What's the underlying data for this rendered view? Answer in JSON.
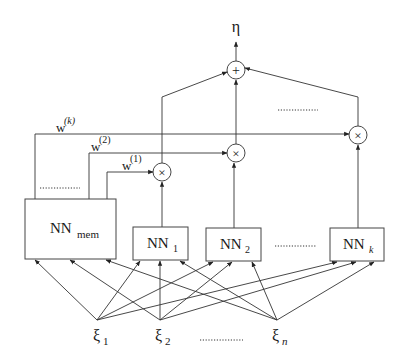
{
  "diagram": {
    "type": "neural-network-ensemble",
    "output": {
      "label": "η"
    },
    "sum_node": {
      "symbol": "+"
    },
    "product_nodes": [
      {
        "id": "x1",
        "symbol": "×"
      },
      {
        "id": "x2",
        "symbol": "×"
      },
      {
        "id": "xk",
        "symbol": "×"
      }
    ],
    "weights": [
      {
        "base": "w",
        "sup": "(1)"
      },
      {
        "base": "w",
        "sup": "(2)"
      },
      {
        "base": "w",
        "sup": "(k)"
      }
    ],
    "networks": {
      "memory": {
        "base": "NN",
        "sub": "mem"
      },
      "experts": [
        {
          "base": "NN",
          "sub": "1"
        },
        {
          "base": "NN",
          "sub": "2"
        },
        {
          "base": "NN",
          "sub": "k"
        }
      ]
    },
    "inputs": [
      {
        "base": "ξ",
        "sub": "1"
      },
      {
        "base": "ξ",
        "sub": "2"
      },
      {
        "base": "ξ",
        "sub": "n"
      }
    ],
    "ellipsis": "............",
    "colors": {
      "line": "#333333",
      "text": "#1a1a1a",
      "background": "#ffffff"
    }
  }
}
